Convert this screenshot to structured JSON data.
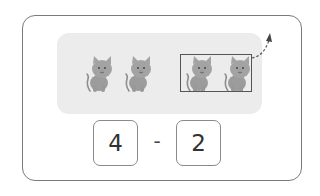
{
  "figure": {
    "cats_total": 4,
    "cats_removed": 2,
    "equation": {
      "minuend": "4",
      "operator": "-",
      "subtrahend": "2"
    },
    "colors": {
      "panel": "#ececec",
      "cat": "#9a9a9a",
      "border": "#7a7a7a"
    }
  }
}
